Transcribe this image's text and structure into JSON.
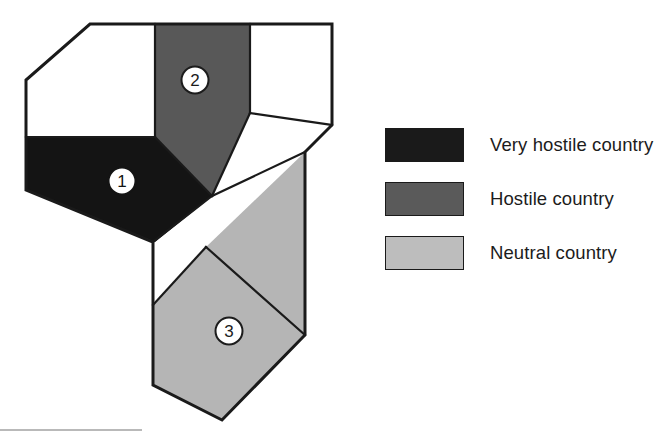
{
  "figure": {
    "type": "thematic-map",
    "background_color": "#ffffff",
    "outline_color": "#1a1a1a"
  },
  "map": {
    "name": "country-hostility-map",
    "regions": [
      {
        "id": "region-1",
        "marker_label": "1",
        "category": "Very hostile country",
        "fill": "#141414",
        "marker_text_color": "#141414",
        "marker_x": 122,
        "marker_y": 181,
        "points": "26,137 155,137 212,196 155,242 26,190"
      },
      {
        "id": "region-2",
        "marker_label": "2",
        "category": "Hostile country",
        "fill": "#585858",
        "marker_text_color": "#1c1c1c",
        "marker_x": 195,
        "marker_y": 80,
        "points": "155,24 250,24 250,113 212,196 155,137"
      },
      {
        "id": "region-3",
        "marker_label": "3",
        "category": "Neutral country",
        "fill": "#b5b5b5",
        "marker_text_color": "#1c1c1c",
        "marker_x": 229,
        "marker_y": 331,
        "points": "206,247 305,152 305,335 222,420 153,385 153,305"
      },
      {
        "id": "region-unshaded-northwest",
        "marker_label": "",
        "category": "",
        "fill": "#ffffff",
        "points": "90,24 155,24 155,137 26,137 26,80"
      },
      {
        "id": "region-unshaded-northeast",
        "marker_label": "",
        "category": "",
        "fill": "#ffffff",
        "points": "250,24 332,24 332,125 250,113"
      },
      {
        "id": "region-unshaded-center",
        "marker_label": "",
        "category": "",
        "fill": "#ffffff",
        "points": "250,113 332,125 305,152 206,247 153,305 153,242 212,196"
      }
    ],
    "outer_boundary": "90,24 332,24 332,125 305,152 305,335 222,420 153,385 153,242 26,190 26,80",
    "internal_edges": [
      "26,137 155,137",
      "155,24 155,137",
      "250,24 250,113",
      "155,137 212,196",
      "212,196 250,113",
      "212,196 153,242",
      "212,196 305,152",
      "153,305 206,247",
      "206,247 305,335"
    ]
  },
  "legend": {
    "name": "map-legend",
    "items": [
      {
        "label": "Very hostile country",
        "color": "#1a1a1a"
      },
      {
        "label": "Hostile country",
        "color": "#5a5a5a"
      },
      {
        "label": "Neutral country",
        "color": "#bdbdbd"
      }
    ]
  }
}
